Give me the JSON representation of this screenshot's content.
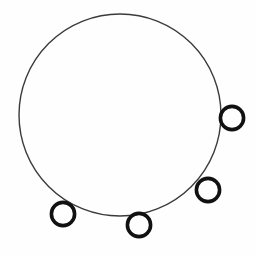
{
  "figure": {
    "background_color": "#fefefe",
    "canvas": {
      "width": 256,
      "height": 256
    },
    "main_circle": {
      "name": "main-circle",
      "cx": 120,
      "cy": 115,
      "r": 101,
      "stroke_color": "#3b3b3b",
      "stroke_width": 1.4,
      "fill": "none"
    },
    "rings": [
      {
        "name": "ring-right",
        "label": "right ring",
        "cx": 232,
        "cy": 118,
        "r": 11.6,
        "stroke_color": "#111111",
        "stroke_width": 3.6,
        "fill": "none"
      },
      {
        "name": "ring-lower-right",
        "label": "lower-right ring",
        "cx": 208,
        "cy": 190,
        "r": 11.6,
        "stroke_color": "#111111",
        "stroke_width": 3.6,
        "fill": "none"
      },
      {
        "name": "ring-bottom-center",
        "label": "bottom-center ring",
        "cx": 139,
        "cy": 225,
        "r": 11.6,
        "stroke_color": "#111111",
        "stroke_width": 3.6,
        "fill": "none"
      },
      {
        "name": "ring-bottom-left",
        "label": "bottom-left ring",
        "cx": 63,
        "cy": 214,
        "r": 11.6,
        "stroke_color": "#111111",
        "stroke_width": 3.6,
        "fill": "none"
      }
    ],
    "ring_count": 4
  }
}
